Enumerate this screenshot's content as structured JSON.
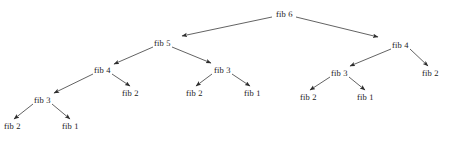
{
  "diagram": {
    "type": "tree",
    "background_color": "#ffffff",
    "line_color": "#3b3b3b",
    "text_color": "#1b1b1b",
    "width": 449,
    "height": 142
  },
  "nodes": [
    {
      "id": "n0",
      "label": "fib 6",
      "x": 276,
      "y": 9,
      "depth": 0
    },
    {
      "id": "n1",
      "label": "fib 5",
      "x": 154,
      "y": 38,
      "depth": 1
    },
    {
      "id": "n2",
      "label": "fib 4",
      "x": 392,
      "y": 40,
      "depth": 1
    },
    {
      "id": "n3",
      "label": "fib 4",
      "x": 94,
      "y": 65,
      "depth": 2
    },
    {
      "id": "n4",
      "label": "fib 3",
      "x": 214,
      "y": 65,
      "depth": 2
    },
    {
      "id": "n5",
      "label": "fib 3",
      "x": 331,
      "y": 68,
      "depth": 2
    },
    {
      "id": "n6",
      "label": "fib 2",
      "x": 422,
      "y": 68,
      "depth": 2
    },
    {
      "id": "n7",
      "label": "fib 3",
      "x": 34,
      "y": 95,
      "depth": 3
    },
    {
      "id": "n8",
      "label": "fib 2",
      "x": 122,
      "y": 88,
      "depth": 3
    },
    {
      "id": "n9",
      "label": "fib 2",
      "x": 186,
      "y": 88,
      "depth": 3
    },
    {
      "id": "n10",
      "label": "fib 1",
      "x": 244,
      "y": 88,
      "depth": 3
    },
    {
      "id": "n11",
      "label": "fib 2",
      "x": 300,
      "y": 92,
      "depth": 3
    },
    {
      "id": "n12",
      "label": "fib 1",
      "x": 357,
      "y": 92,
      "depth": 3
    },
    {
      "id": "n13",
      "label": "fib 2",
      "x": 4,
      "y": 121,
      "depth": 4
    },
    {
      "id": "n14",
      "label": "fib 1",
      "x": 62,
      "y": 121,
      "depth": 4
    }
  ],
  "edges": [
    {
      "from": "fib 6",
      "to": "fib 5",
      "x1": 272,
      "y1": 17,
      "x2": 182,
      "y2": 36,
      "arrow": true
    },
    {
      "from": "fib 6",
      "to": "fib 4",
      "x1": 296,
      "y1": 17,
      "x2": 378,
      "y2": 37,
      "arrow": true
    },
    {
      "from": "fib 5",
      "to": "fib 4",
      "x1": 153,
      "y1": 47,
      "x2": 114,
      "y2": 64,
      "arrow": true
    },
    {
      "from": "fib 5",
      "to": "fib 3",
      "x1": 172,
      "y1": 47,
      "x2": 211,
      "y2": 63,
      "arrow": true
    },
    {
      "from": "fib 4",
      "to": "fib 3",
      "x1": 93,
      "y1": 74,
      "x2": 54,
      "y2": 93,
      "arrow": true
    },
    {
      "from": "fib 4",
      "to": "fib 2",
      "x1": 112,
      "y1": 74,
      "x2": 130,
      "y2": 86,
      "arrow": true
    },
    {
      "from": "fib 3",
      "to": "fib 2",
      "x1": 212,
      "y1": 74,
      "x2": 196,
      "y2": 86,
      "arrow": true
    },
    {
      "from": "fib 3",
      "to": "fib 1",
      "x1": 232,
      "y1": 74,
      "x2": 250,
      "y2": 86,
      "arrow": true
    },
    {
      "from": "fib 3",
      "to": "fib 2",
      "x1": 33,
      "y1": 104,
      "x2": 14,
      "y2": 119,
      "arrow": true
    },
    {
      "from": "fib 3",
      "to": "fib 1",
      "x1": 52,
      "y1": 104,
      "x2": 70,
      "y2": 119,
      "arrow": true
    },
    {
      "from": "fib 4",
      "to": "fib 3",
      "x1": 391,
      "y1": 49,
      "x2": 350,
      "y2": 66,
      "arrow": true
    },
    {
      "from": "fib 4",
      "to": "fib 2",
      "x1": 410,
      "y1": 49,
      "x2": 428,
      "y2": 66,
      "arrow": true
    },
    {
      "from": "fib 3",
      "to": "fib 2",
      "x1": 330,
      "y1": 77,
      "x2": 310,
      "y2": 90,
      "arrow": true
    },
    {
      "from": "fib 3",
      "to": "fib 1",
      "x1": 349,
      "y1": 77,
      "x2": 365,
      "y2": 90,
      "arrow": true
    }
  ]
}
